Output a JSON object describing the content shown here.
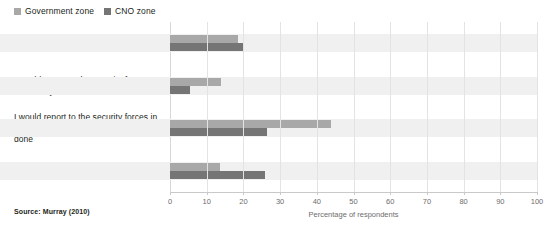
{
  "legend": {
    "position": "top-left",
    "entries": [
      {
        "label": "Government zone",
        "color": "#a8a8a8",
        "swatch_icon": "square-swatch-icon"
      },
      {
        "label": "CNO zone",
        "color": "#757575",
        "swatch_icon": "square-swatch-icon"
      }
    ]
  },
  "source": {
    "text": "Source: Murray (2010)"
  },
  "chart_data": {
    "type": "bar",
    "orientation": "horizontal",
    "title": "",
    "subtitle": "",
    "xlabel": "Percentage of respondents",
    "ylabel": "",
    "xlim": [
      0,
      100
    ],
    "xticks": [
      0,
      10,
      20,
      30,
      40,
      50,
      60,
      70,
      80,
      90,
      100
    ],
    "xtick_labels": [
      "0",
      "10",
      "20",
      "30",
      "40",
      "50",
      "60",
      "70",
      "80",
      "90",
      "100"
    ],
    "grid": true,
    "grid_axis": "x",
    "legend_position": "top-left",
    "categories": [
      "Nothing",
      "I would report to the security forces as a formality",
      "I would report to the security forces in the hope that something would be done",
      "I would put my fate in God's hands"
    ],
    "series": [
      {
        "name": "Government zone",
        "color": "#a8a8a8",
        "values": [
          18.5,
          14,
          44,
          13.5
        ]
      },
      {
        "name": "CNO zone",
        "color": "#757575",
        "values": [
          20,
          5.5,
          26.5,
          26
        ]
      }
    ]
  }
}
